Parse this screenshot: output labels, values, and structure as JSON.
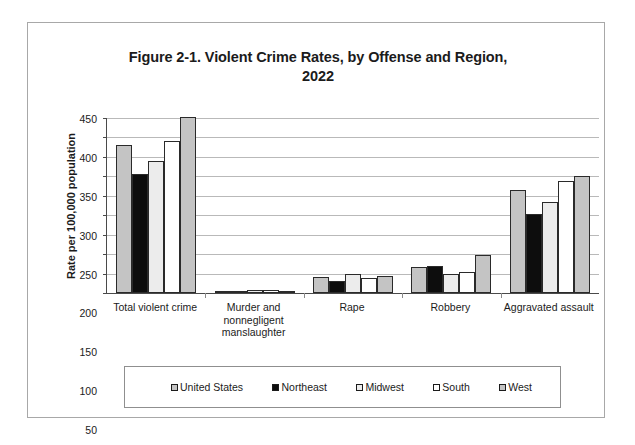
{
  "figure": {
    "title_line1": "Figure 2-1. Violent Crime Rates, by Offense and Region,",
    "title_line2": "2022"
  },
  "chart_data": {
    "type": "bar",
    "title": "Figure 2-1. Violent Crime Rates, by Offense and Region, 2022",
    "xlabel": "",
    "ylabel": "Rate per 100,000 population",
    "ylim": [
      0,
      450
    ],
    "ytick_step": 50,
    "yticks": [
      0,
      50,
      100,
      150,
      200,
      250,
      300,
      350,
      400,
      450
    ],
    "ytick_labels": [
      "0",
      "50",
      "100",
      "150",
      "200",
      "250",
      "300",
      "350",
      "400",
      "450"
    ],
    "grid": true,
    "legend_position": "bottom",
    "categories": [
      "Total violent crime",
      "Murder and nonnegligent manslaughter",
      "Rape",
      "Robbery",
      "Aggravated assault"
    ],
    "category_label_lines": [
      [
        "Total violent crime"
      ],
      [
        "Murder and",
        "nonnegligent",
        "manslaughter"
      ],
      [
        "Rape"
      ],
      [
        "Robbery"
      ],
      [
        "Aggravated assault"
      ]
    ],
    "series": [
      {
        "name": "United States",
        "color": "#c4c4c4",
        "values": [
          380,
          6,
          40,
          66,
          266
        ]
      },
      {
        "name": "Northeast",
        "color": "#0d0d0d",
        "values": [
          305,
          4,
          30,
          70,
          203
        ]
      },
      {
        "name": "Midwest",
        "color": "#ececec",
        "values": [
          340,
          7,
          48,
          50,
          234
        ]
      },
      {
        "name": "South",
        "color": "#ffffff",
        "values": [
          390,
          8,
          38,
          54,
          288
        ]
      },
      {
        "name": "West",
        "color": "#c4c4c4",
        "values": [
          452,
          6,
          45,
          97,
          300
        ]
      }
    ]
  },
  "legend": {
    "items": [
      {
        "label": "United States",
        "color": "#c4c4c4"
      },
      {
        "label": "Northeast",
        "color": "#0d0d0d"
      },
      {
        "label": "Midwest",
        "color": "#ececec"
      },
      {
        "label": "South",
        "color": "#ffffff"
      },
      {
        "label": "West",
        "color": "#c4c4c4"
      }
    ]
  }
}
